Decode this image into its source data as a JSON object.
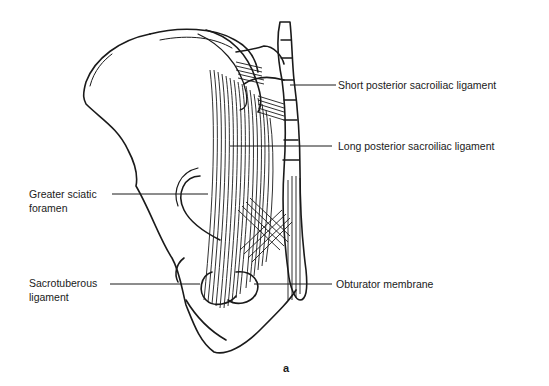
{
  "figure": {
    "caption": "a",
    "labels": {
      "short_posterior": "Short posterior sacroiliac ligament",
      "long_posterior": "Long posterior sacroiliac ligament",
      "greater_sciatic_1": "Greater sciatic",
      "greater_sciatic_2": "foramen",
      "sacrotuberous_1": "Sacrotuberous",
      "sacrotuberous_2": "ligament",
      "obturator": "Obturator membrane"
    },
    "colors": {
      "ink": "#1a1a1a",
      "background": "#ffffff"
    }
  }
}
